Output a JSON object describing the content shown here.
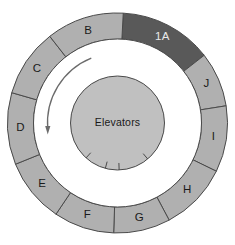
{
  "diagram": {
    "type": "radial-floor-plan",
    "geometry": {
      "center_x": 117.5,
      "center_y": 123,
      "outer_radius": 110,
      "ring_inner_radius": 84,
      "corridor_inner_radius": 56,
      "core_radius": 47,
      "label_radius": 97
    },
    "colors": {
      "ring_fill": "#b0b0b0",
      "ring_highlight_fill": "#595959",
      "core_fill": "#c0c0c0",
      "corridor_fill": "#ffffff",
      "stroke": "#4a4a4a",
      "label_text": "#1a1a1a",
      "label_text_on_dark": "#e8e8e8",
      "arrow": "#6b6b6b",
      "background": "#ffffff"
    },
    "core": {
      "label": "Elevators",
      "door_notch_count": 4
    },
    "circulation_arrow": {
      "direction": "counterclockwise",
      "description": "curved arrow in corridor pointing downward on the left side"
    },
    "segments": [
      {
        "id": "seg-1a",
        "label": "1A",
        "start_angle": -87,
        "end_angle": -38,
        "highlighted": true
      },
      {
        "id": "seg-j",
        "label": "J",
        "start_angle": -38,
        "end_angle": -9,
        "highlighted": false
      },
      {
        "id": "seg-i",
        "label": "I",
        "start_angle": -9,
        "end_angle": 26,
        "highlighted": false
      },
      {
        "id": "seg-h",
        "label": "H",
        "start_angle": 26,
        "end_angle": 62,
        "highlighted": false
      },
      {
        "id": "seg-g",
        "label": "G",
        "start_angle": 62,
        "end_angle": 92,
        "highlighted": false
      },
      {
        "id": "seg-f",
        "label": "F",
        "start_angle": 92,
        "end_angle": 124,
        "highlighted": false
      },
      {
        "id": "seg-e",
        "label": "E",
        "start_angle": 124,
        "end_angle": 158,
        "highlighted": false
      },
      {
        "id": "seg-d",
        "label": "D",
        "start_angle": 158,
        "end_angle": 196,
        "highlighted": false
      },
      {
        "id": "seg-c",
        "label": "C",
        "start_angle": 196,
        "end_angle": 232,
        "highlighted": false
      },
      {
        "id": "seg-b",
        "label": "B",
        "start_angle": 232,
        "end_angle": 273,
        "highlighted": false
      }
    ]
  }
}
